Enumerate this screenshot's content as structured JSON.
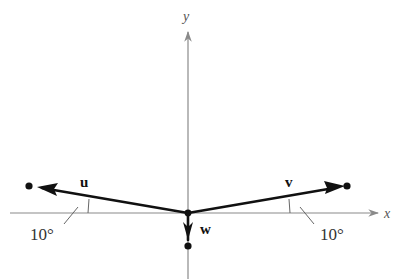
{
  "diagram": {
    "axes": {
      "x_label": "x",
      "y_label": "y",
      "axis_color": "#8a8a8a"
    },
    "vectors": [
      {
        "name": "u",
        "label": "u",
        "direction": "left",
        "angle_from_x_axis_deg": 10
      },
      {
        "name": "v",
        "label": "v",
        "direction": "right",
        "angle_from_x_axis_deg": 10
      },
      {
        "name": "w",
        "label": "w",
        "direction": "down"
      }
    ],
    "angle_labels": {
      "left": "10°",
      "right": "10°"
    },
    "vector_color": "#111111"
  }
}
